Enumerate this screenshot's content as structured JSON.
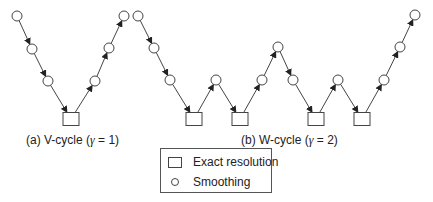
{
  "diagram": {
    "v_cycle": {
      "label": "(a) V-cycle (",
      "gamma_symbol": "γ",
      "gamma_value": " = 1)",
      "nodes": [
        {
          "type": "smoothing",
          "x": 17,
          "y": 16
        },
        {
          "type": "smoothing",
          "x": 32,
          "y": 49
        },
        {
          "type": "smoothing",
          "x": 48,
          "y": 81
        },
        {
          "type": "exact",
          "x": 71,
          "y": 119
        },
        {
          "type": "smoothing",
          "x": 95,
          "y": 81
        },
        {
          "type": "smoothing",
          "x": 109,
          "y": 48
        },
        {
          "type": "smoothing",
          "x": 124,
          "y": 16
        }
      ]
    },
    "w_cycle": {
      "label": "(b) W-cycle (",
      "gamma_symbol": "γ",
      "gamma_value": " = 2)",
      "nodes": [
        {
          "type": "smoothing",
          "x": 138,
          "y": 16
        },
        {
          "type": "smoothing",
          "x": 154,
          "y": 48
        },
        {
          "type": "smoothing",
          "x": 170,
          "y": 80
        },
        {
          "type": "exact",
          "x": 194,
          "y": 119
        },
        {
          "type": "smoothing",
          "x": 216,
          "y": 80
        },
        {
          "type": "exact",
          "x": 240,
          "y": 119
        },
        {
          "type": "smoothing",
          "x": 262,
          "y": 80
        },
        {
          "type": "smoothing",
          "x": 278,
          "y": 47
        },
        {
          "type": "smoothing",
          "x": 293,
          "y": 80
        },
        {
          "type": "exact",
          "x": 316,
          "y": 119
        },
        {
          "type": "smoothing",
          "x": 338,
          "y": 80
        },
        {
          "type": "exact",
          "x": 362,
          "y": 119
        },
        {
          "type": "smoothing",
          "x": 384,
          "y": 80
        },
        {
          "type": "smoothing",
          "x": 400,
          "y": 47
        },
        {
          "type": "smoothing",
          "x": 415,
          "y": 15
        }
      ]
    },
    "legend": {
      "exact_label": "Exact resolution",
      "smoothing_label": "Smoothing"
    },
    "colors": {
      "stroke": "#444444",
      "text": "#222222",
      "background": "#ffffff"
    }
  }
}
